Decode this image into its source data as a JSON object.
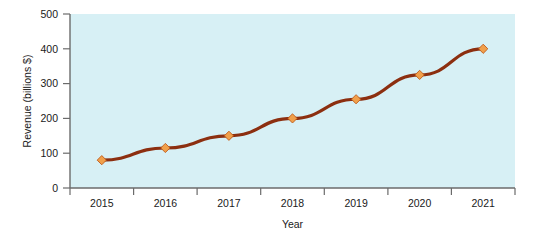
{
  "chart_data": {
    "type": "line",
    "title": "",
    "xlabel": "Year",
    "ylabel": "Revenue (billions $)",
    "categories": [
      "2015",
      "2016",
      "2017",
      "2018",
      "2019",
      "2020",
      "2021"
    ],
    "x": [
      2015,
      2016,
      2017,
      2018,
      2019,
      2020,
      2021
    ],
    "values": [
      80,
      115,
      150,
      200,
      255,
      325,
      400
    ],
    "series": [
      {
        "name": "Revenue",
        "values": [
          80,
          115,
          150,
          200,
          255,
          325,
          400
        ]
      }
    ],
    "ylim": [
      0,
      500
    ],
    "yticks": [
      0,
      100,
      200,
      300,
      400,
      500
    ],
    "ytick_labels": [
      "0",
      "100",
      "200",
      "300",
      "400",
      "500"
    ],
    "xtick_labels": [
      "2015",
      "2016",
      "2017",
      "2018",
      "2019",
      "2020",
      "2021"
    ],
    "grid": false,
    "legend": false,
    "legend_position": "none",
    "marker": "diamond",
    "colors": {
      "line": "#8c2f10",
      "marker_fill": "#f0a04b",
      "marker_edge": "#c05a1a",
      "plot_background": "#d7f0f5",
      "figure_background": "#ffffff",
      "axis": "#6b6b6b",
      "text": "#1a1a1a"
    }
  }
}
